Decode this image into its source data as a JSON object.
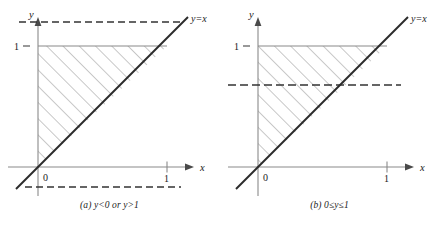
{
  "figure": {
    "type": "math-figure"
  },
  "colors": {
    "axis": "#8a8a8a",
    "line_yx": "#2b2b2b",
    "hatch": "#9a9a9a",
    "dashed": "#333333",
    "text": "#1a1a1a",
    "background": "#ffffff"
  },
  "panels": [
    {
      "id": "a",
      "caption": "(a) y<0 or y>1",
      "caption_parts": {
        "label": "(a)",
        "body": "y<0 or y>1"
      },
      "axes": {
        "x_label": "x",
        "y_label": "y",
        "origin_label": "0",
        "x_ticks": [
          {
            "value": 1,
            "label": "1"
          }
        ],
        "y_ticks": [
          {
            "value": 1,
            "label": "1"
          }
        ]
      },
      "line_label": "y=x",
      "dashed_lines": [
        {
          "name": "upper-dashed-line",
          "y_value": 1.45,
          "note": "above y=1"
        },
        {
          "name": "lower-dashed-line",
          "y_value": -0.17,
          "note": "below y=0"
        }
      ],
      "shaded_region": {
        "vertices": [
          [
            0,
            0
          ],
          [
            0,
            1
          ],
          [
            1,
            1
          ]
        ],
        "hatch_angle_deg": 45
      }
    },
    {
      "id": "b",
      "caption": "(b) 0≤y≤1",
      "caption_parts": {
        "label": "(b)",
        "body": "0≤y≤1"
      },
      "axes": {
        "x_label": "x",
        "y_label": "y",
        "origin_label": "0",
        "x_ticks": [
          {
            "value": 1,
            "label": "1"
          }
        ],
        "y_ticks": [
          {
            "value": 1,
            "label": "1"
          }
        ]
      },
      "line_label": "y=x",
      "dashed_lines": [
        {
          "name": "mid-dashed-line",
          "y_value": 0.68,
          "note": "between 0 and 1"
        }
      ],
      "shaded_region": {
        "vertices": [
          [
            0,
            0
          ],
          [
            0,
            1
          ],
          [
            1,
            1
          ]
        ],
        "hatch_angle_deg": 45
      }
    }
  ]
}
